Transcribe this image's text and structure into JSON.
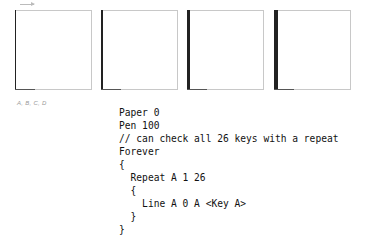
{
  "figure": {
    "panels": [
      {
        "id": "A",
        "left": 15,
        "left_line_width": 1
      },
      {
        "id": "B",
        "left": 101,
        "left_line_width": 2
      },
      {
        "id": "C",
        "left": 187,
        "left_line_width": 3
      },
      {
        "id": "D",
        "left": 274,
        "left_line_width": 4
      }
    ],
    "caption": "A, B, C, D"
  },
  "code": {
    "lines": [
      "Paper 0",
      "Pen 100",
      "// can check all 26 keys with a repeat",
      "Forever",
      "{",
      "  Repeat A 1 26",
      "  {",
      "    Line A 0 A <Key A>",
      "  }",
      "}"
    ]
  }
}
